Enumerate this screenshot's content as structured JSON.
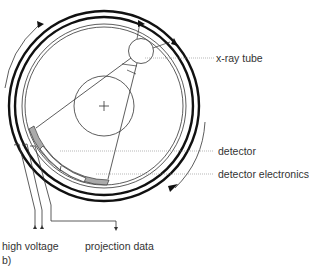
{
  "diagram": {
    "subfigure_label": "b)",
    "labels": {
      "xray_tube": "x-ray tube",
      "detector": "detector",
      "detector_electronics": "detector electronics",
      "high_voltage": "high voltage",
      "projection_data": "projection data"
    },
    "colors": {
      "stroke": "#111111",
      "thin_stroke": "#333333",
      "detector_fill": "#aaaaaa",
      "leader_line": "#888888",
      "text": "#333333"
    }
  }
}
